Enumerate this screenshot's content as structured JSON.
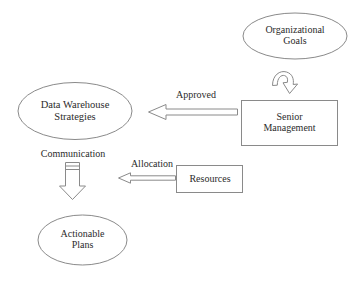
{
  "diagram": {
    "background_color": "#ffffff",
    "stroke_color": "#8a8a8a",
    "text_color": "#2b2b2b",
    "nodes": {
      "organizational_goals": {
        "label": "Organizational\nGoals",
        "shape": "ellipse"
      },
      "senior_management": {
        "label": "Senior\nManagement",
        "shape": "rectangle"
      },
      "data_warehouse_strategies": {
        "label": "Data Warehouse\nStrategies",
        "shape": "ellipse"
      },
      "resources": {
        "label": "Resources",
        "shape": "rectangle"
      },
      "actionable_plans": {
        "label": "Actionable\nPlans",
        "shape": "ellipse"
      }
    },
    "edges": {
      "goals_feedback": {
        "label": "",
        "from": "senior_management",
        "to": "organizational_goals",
        "style": "curved-hook-arrow"
      },
      "approved": {
        "label": "Approved",
        "from": "senior_management",
        "to": "data_warehouse_strategies",
        "style": "block-arrow-left"
      },
      "communication": {
        "label": "Communication",
        "from": "data_warehouse_strategies",
        "to": "actionable_plans",
        "style": "block-arrow-down"
      },
      "allocation": {
        "label": "Allocation",
        "from": "resources",
        "to": "communication",
        "style": "block-arrow-left"
      }
    }
  }
}
